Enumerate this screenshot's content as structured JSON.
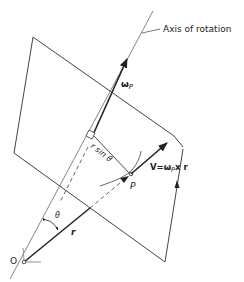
{
  "diagram": {
    "labels": {
      "axis": "Axis of rotation",
      "omega": "ω",
      "omega_sub": "P",
      "r_sin_theta": "r sin θ",
      "point_p": "P",
      "velocity": "V=ω",
      "velocity_sub": "P",
      "velocity_tail": "x r",
      "theta": "θ",
      "r": "r",
      "origin": "O"
    },
    "elements": [
      {
        "id": "plane",
        "type": "quadrilateral"
      },
      {
        "id": "axis-of-rotation",
        "type": "line"
      },
      {
        "id": "omega-vector",
        "type": "arrow"
      },
      {
        "id": "position-vector-r",
        "type": "arrow"
      },
      {
        "id": "velocity-vector",
        "type": "arrow"
      },
      {
        "id": "perpendicular-r-sin-theta",
        "type": "line"
      },
      {
        "id": "circular-path",
        "type": "arc"
      },
      {
        "id": "angle-theta",
        "type": "arc"
      }
    ],
    "colors": {
      "line": "#333333",
      "text": "#222222"
    }
  }
}
